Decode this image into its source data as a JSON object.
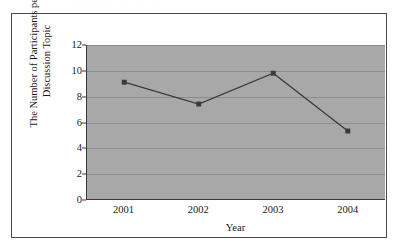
{
  "figure": {
    "top_artifact_text": "........ ...  ..  ..",
    "background_color": "#ffffff",
    "frame_color": "#4a4a4a"
  },
  "chart_data": {
    "type": "line",
    "title": "",
    "subtitle": "",
    "categories": [
      "2001",
      "2002",
      "2003",
      "2004"
    ],
    "values": [
      9.1,
      7.4,
      9.8,
      5.3
    ],
    "series": [
      {
        "name": "The Number of Participants per Discussion Topic",
        "values": [
          9.1,
          7.4,
          9.8,
          5.3
        ],
        "line_color": "#3a3a3a",
        "marker_color": "#3a3a3a",
        "marker_shape": "square"
      }
    ],
    "xlabel": "Year",
    "ylabel_line1": "The Number of Participants per",
    "ylabel_line2": "Discussion Topic",
    "ylabel": "The Number of Participants per Discussion Topic",
    "ylim": [
      0,
      12
    ],
    "yticks": [
      0,
      2,
      4,
      6,
      8,
      10,
      12
    ],
    "ytick_labels": [
      "0",
      "2",
      "4",
      "6",
      "8",
      "10",
      "12"
    ],
    "xtick_labels": [
      "2001",
      "2002",
      "2003",
      "2004"
    ],
    "grid": true,
    "grid_axis": "y",
    "grid_color": "#8d8d8d",
    "legend": false,
    "legend_position": "none",
    "plot_background_color": "#a8a8a8",
    "axis_color": "#3a3a3a"
  }
}
